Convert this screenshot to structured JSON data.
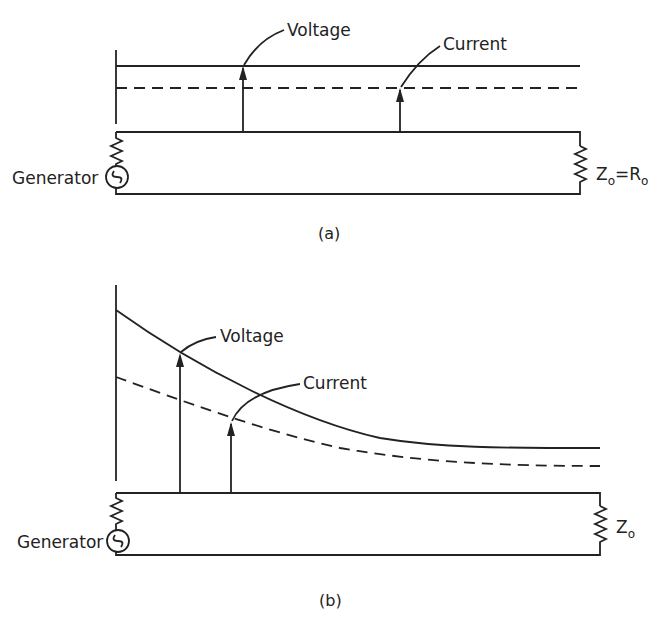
{
  "figure": {
    "panels": [
      {
        "id": "a",
        "caption": "(a)",
        "voltage_label": "Voltage",
        "current_label": "Current",
        "generator_label": "Generator",
        "load_label_main": "Z",
        "load_label_sub": "o",
        "load_label_eq": "=",
        "load_label_main2": "R",
        "load_label_sub2": "o",
        "description": "Matched line: voltage and current constant along the line"
      },
      {
        "id": "b",
        "caption": "(b)",
        "voltage_label": "Voltage",
        "current_label": "Current",
        "generator_label": "Generator",
        "load_label_main": "Z",
        "load_label_sub": "o",
        "description": "Lossy line: voltage and current decay exponentially along the line"
      }
    ],
    "colors": {
      "ink": "#222222",
      "background": "#ffffff"
    }
  }
}
